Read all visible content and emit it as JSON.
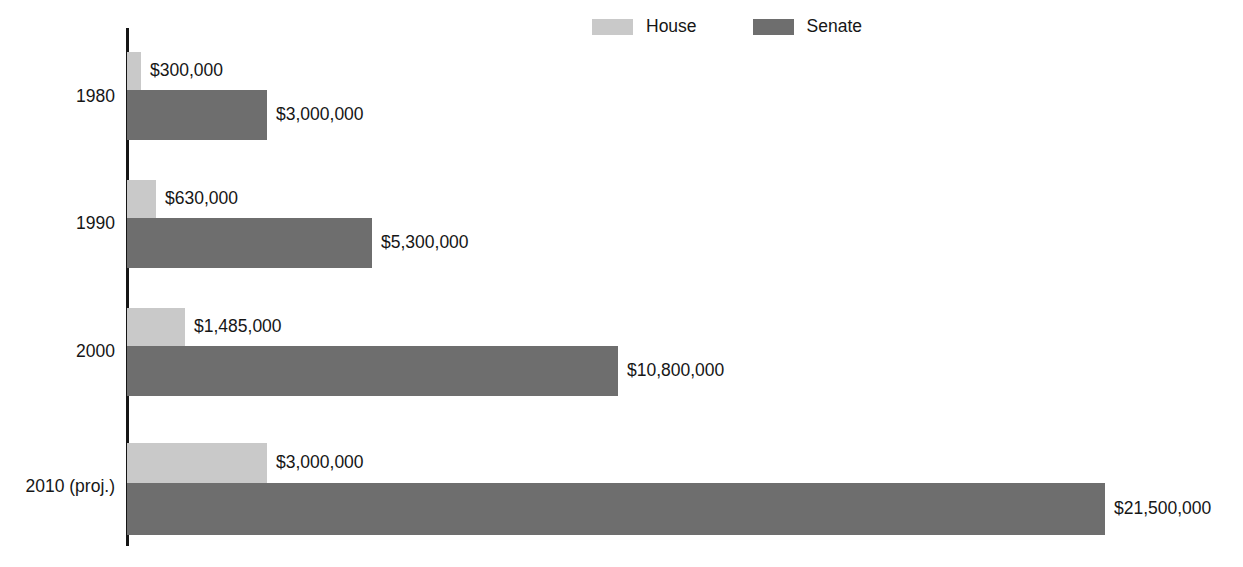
{
  "legend": {
    "position": "top-center",
    "entries": [
      {
        "label": "House",
        "color": "#c9c9c9",
        "swatch_name": "legend-swatch-house"
      },
      {
        "label": "Senate",
        "color": "#6e6e6e",
        "swatch_name": "legend-swatch-senate"
      }
    ]
  },
  "chart_data": {
    "type": "bar",
    "orientation": "horizontal",
    "title": "",
    "subtitle": "",
    "xlabel": "",
    "ylabel": "",
    "grid": false,
    "legend_position": "top-center",
    "xlim": [
      0,
      21500000
    ],
    "axis_visible": {
      "x": false,
      "y": true
    },
    "categories": [
      "1980",
      "1990",
      "2000",
      "2010 (proj.)"
    ],
    "series": [
      {
        "name": "House",
        "color": "#c9c9c9",
        "values": [
          300000,
          630000,
          1485000,
          3000000
        ],
        "labels": [
          "$300,000",
          "$630,000",
          "$1,485,000",
          "$3,000,000"
        ]
      },
      {
        "name": "Senate",
        "color": "#6e6e6e",
        "values": [
          3000000,
          5300000,
          10800000,
          21500000
        ],
        "labels": [
          "$3,000,000",
          "$5,300,000",
          "$10,800,000",
          "$21,500,000"
        ]
      }
    ]
  },
  "groups": [
    {
      "category": "1980",
      "label_top": 88,
      "bars": [
        {
          "series": "House",
          "value_label": "$300,000",
          "color": "#c9c9c9",
          "top": 52,
          "height": 38,
          "width": 14
        },
        {
          "series": "Senate",
          "value_label": "$3,000,000",
          "color": "#6e6e6e",
          "top": 90,
          "height": 50,
          "width": 140
        }
      ]
    },
    {
      "category": "1990",
      "label_top": 215,
      "bars": [
        {
          "series": "House",
          "value_label": "$630,000",
          "color": "#c9c9c9",
          "top": 180,
          "height": 38,
          "width": 29
        },
        {
          "series": "Senate",
          "value_label": "$5,300,000",
          "color": "#6e6e6e",
          "top": 218,
          "height": 50,
          "width": 245
        }
      ]
    },
    {
      "category": "2000",
      "label_top": 343,
      "bars": [
        {
          "series": "House",
          "value_label": "$1,485,000",
          "color": "#c9c9c9",
          "top": 308,
          "height": 38,
          "width": 58
        },
        {
          "series": "Senate",
          "value_label": "$10,800,000",
          "color": "#6e6e6e",
          "top": 346,
          "height": 50,
          "width": 491
        }
      ]
    },
    {
      "category": "2010 (proj.)",
      "label_top": 478,
      "bars": [
        {
          "series": "House",
          "value_label": "$3,000,000",
          "color": "#c9c9c9",
          "top": 443,
          "height": 40,
          "width": 140
        },
        {
          "series": "Senate",
          "value_label": "$21,500,000",
          "color": "#6e6e6e",
          "top": 483,
          "height": 52,
          "width": 978
        }
      ]
    }
  ]
}
